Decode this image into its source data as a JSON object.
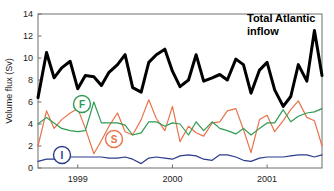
{
  "figure": {
    "title": "",
    "background": "#ffffff"
  },
  "axes": {
    "ylabel": "Volume flux (Sv)",
    "xlabel": "",
    "yticks": [
      "0",
      "2",
      "4",
      "6",
      "8",
      "10",
      "12",
      "14"
    ],
    "xticks": [
      "1999",
      "2000",
      "2001"
    ]
  },
  "annotations": {
    "total_line1": "Total Atlantic",
    "total_line2": "inflow",
    "marker_f": "F",
    "marker_s": "S",
    "marker_i": "I"
  },
  "colors": {
    "total": "#000000",
    "svinoy": "#E8734A",
    "faroe": "#2E9B52",
    "iceland": "#2B3C8C",
    "axis": "#6e6e6e"
  },
  "chart_data": {
    "type": "line",
    "title": "Total Atlantic inflow",
    "xlabel": "",
    "ylabel": "Volume flux (Sv)",
    "xlim": [
      1998.58,
      2001.58
    ],
    "ylim": [
      0,
      14
    ],
    "yticks": [
      0,
      2,
      4,
      6,
      8,
      10,
      12,
      14
    ],
    "xticks": [
      1999,
      2000,
      2001
    ],
    "grid": false,
    "legend": "inline-annotations",
    "x": [
      1998.58,
      1998.67,
      1998.75,
      1998.83,
      1998.92,
      1999.0,
      1999.08,
      1999.17,
      1999.25,
      1999.33,
      1999.42,
      1999.5,
      1999.58,
      1999.67,
      1999.75,
      1999.83,
      1999.92,
      2000.0,
      2000.08,
      2000.17,
      2000.25,
      2000.33,
      2000.42,
      2000.5,
      2000.58,
      2000.67,
      2000.75,
      2000.83,
      2000.92,
      2001.0,
      2001.08,
      2001.17,
      2001.25,
      2001.33,
      2001.42,
      2001.5,
      2001.58
    ],
    "series": [
      {
        "name": "Total Atlantic inflow",
        "color": "#000000",
        "width": 3,
        "values": [
          6.4,
          10.5,
          8.2,
          9.1,
          9.7,
          7.2,
          8.4,
          8.3,
          7.5,
          8.7,
          9.4,
          10.3,
          7.3,
          6.9,
          9.6,
          10.3,
          10.8,
          8.8,
          7.4,
          8.0,
          10.3,
          7.9,
          8.2,
          8.5,
          8.0,
          9.9,
          9.4,
          6.8,
          8.9,
          9.6,
          7.1,
          5.6,
          6.5,
          9.4,
          7.9,
          12.5,
          8.4
        ]
      },
      {
        "name": "S",
        "color": "#E8734A",
        "width": 1.2,
        "values": [
          2.0,
          5.2,
          3.6,
          4.4,
          5.0,
          5.4,
          3.6,
          1.3,
          2.5,
          3.8,
          5.0,
          3.3,
          3.0,
          4.4,
          6.2,
          4.5,
          3.4,
          5.6,
          2.4,
          3.8,
          3.2,
          2.9,
          4.1,
          4.2,
          5.2,
          5.4,
          3.5,
          1.4,
          4.4,
          4.8,
          3.3,
          4.3,
          5.3,
          6.1,
          4.6,
          4.3,
          2.0
        ]
      },
      {
        "name": "F",
        "color": "#2E9B52",
        "width": 1.2,
        "values": [
          4.0,
          4.6,
          4.1,
          3.6,
          3.4,
          3.3,
          3.4,
          6.0,
          4.1,
          4.1,
          4.1,
          3.9,
          3.0,
          3.2,
          4.2,
          4.2,
          3.8,
          4.1,
          4.0,
          3.0,
          4.2,
          3.4,
          4.2,
          3.6,
          3.4,
          3.1,
          3.6,
          3.0,
          3.6,
          4.1,
          4.1,
          5.3,
          4.2,
          4.7,
          5.0,
          5.1,
          5.4
        ]
      },
      {
        "name": "I",
        "color": "#2B3C8C",
        "width": 1.2,
        "values": [
          0.6,
          0.8,
          0.8,
          0.9,
          1.0,
          1.0,
          1.0,
          1.0,
          1.0,
          0.9,
          0.9,
          1.0,
          0.8,
          0.4,
          0.9,
          1.0,
          0.9,
          0.8,
          1.1,
          1.2,
          1.1,
          0.8,
          0.7,
          1.2,
          1.2,
          1.0,
          0.7,
          0.6,
          0.9,
          1.0,
          1.0,
          1.0,
          1.1,
          1.2,
          1.2,
          1.0,
          1.2
        ]
      }
    ]
  }
}
